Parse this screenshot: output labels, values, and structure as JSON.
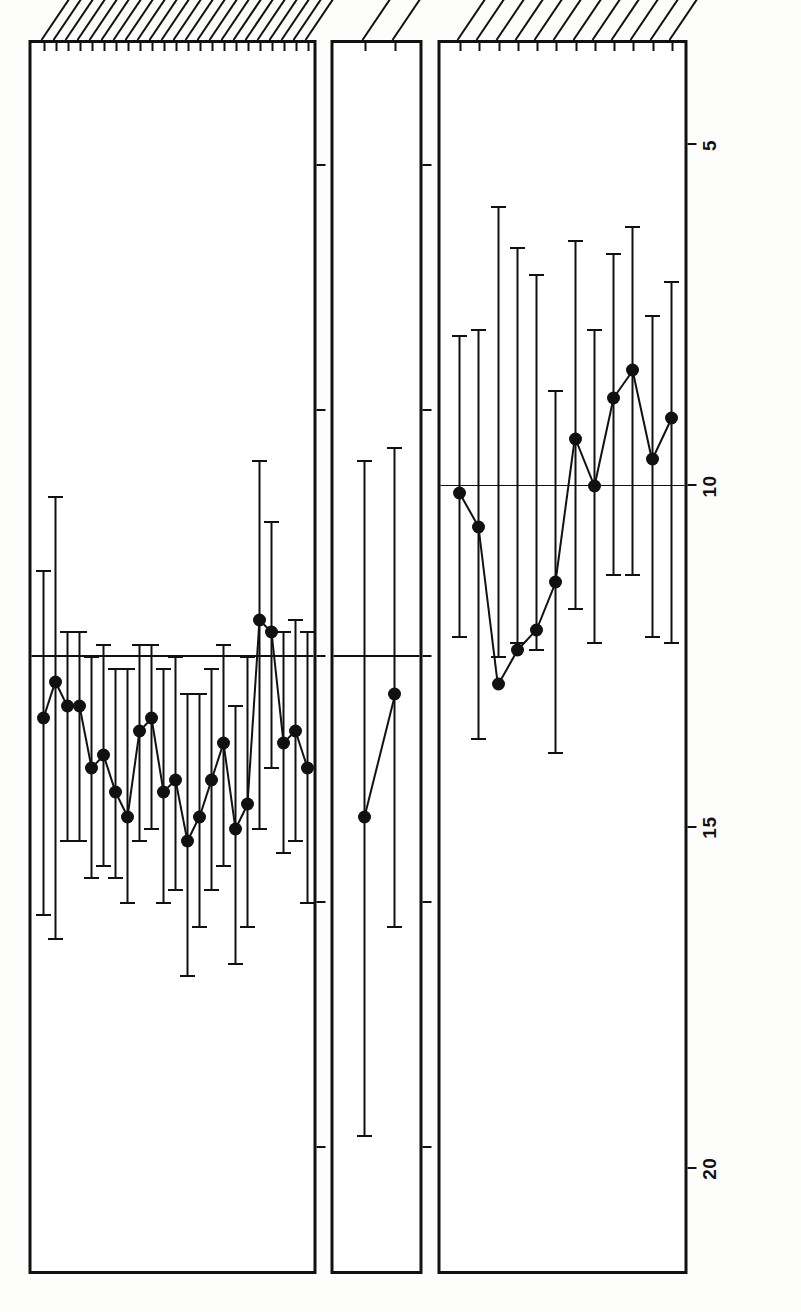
{
  "figure": {
    "orientation": "rotated-90-ccw",
    "background": "#ffffff",
    "ink": "#111111"
  },
  "chart_data": {
    "type": "scatter",
    "title": "",
    "subtitle": "",
    "panels": [
      {
        "id": "t-scores",
        "super_label": "T SCORES",
        "xlabel": "T Score",
        "ticks": [
          70,
          60,
          50,
          40,
          30
        ],
        "tick_labels": [
          "70",
          "60",
          "50",
          "40",
          "30"
        ],
        "xlim": [
          75,
          25
        ],
        "reference_value": 50,
        "grid": false,
        "groups": [
          {
            "label": "MOTOR",
            "from": 0,
            "to": 5
          },
          {
            "label": "PERC—MOTOR",
            "from": 6,
            "to": 9
          },
          {
            "label": "TACTUAL",
            "from": 10,
            "to": 13
          }
        ],
        "categories": [
          "Dyn D",
          "N",
          "Foot D",
          "N",
          "Fin D",
          "N",
          "Std D",
          "N",
          "Maz D",
          "N",
          "Peg D",
          "N",
          "Tac D",
          "N",
          "FAg D",
          "N",
          "L",
          "M",
          "TPT T",
          "CAT",
          "RL",
          "DRAW",
          "MATR"
        ],
        "values": [
          52.5,
          51.0,
          52.0,
          52.0,
          54.5,
          54.0,
          55.5,
          56.5,
          53.0,
          52.5,
          55.5,
          55.0,
          57.5,
          56.5,
          55.0,
          53.5,
          57.0,
          56.0,
          48.5,
          49.0,
          53.5,
          53.0,
          54.5
        ],
        "err_low": [
          46.5,
          43.5,
          49.0,
          49.0,
          50.0,
          49.5,
          50.5,
          50.5,
          49.5,
          49.5,
          50.5,
          50.0,
          51.5,
          51.5,
          50.5,
          49.5,
          52.0,
          50.0,
          42.0,
          44.5,
          49.0,
          48.5,
          49.0
        ],
        "err_high": [
          60.5,
          61.5,
          57.5,
          57.5,
          59.0,
          58.5,
          59.0,
          60.0,
          57.5,
          57.0,
          60.0,
          59.5,
          63.0,
          61.0,
          59.5,
          58.5,
          62.5,
          61.0,
          57.0,
          54.5,
          58.0,
          57.5,
          60.0
        ]
      },
      {
        "id": "maca-quotients",
        "super_label": "MA/CA QUOTIENTS",
        "xlabel": "Quotient",
        "ticks": [
          140,
          120,
          100,
          80,
          60
        ],
        "tick_labels": [
          "140",
          "120",
          "100",
          "80",
          "60"
        ],
        "xlim": [
          150,
          50
        ],
        "reference_value": 100,
        "grid": false,
        "groups": [],
        "categories": [
          "KNOX",
          "PVT"
        ],
        "values": [
          113.0,
          103.0
        ],
        "err_low": [
          84.0,
          83.0
        ],
        "err_high": [
          139.0,
          122.0
        ]
      },
      {
        "id": "wisc-scaled-scores",
        "super_label": "WISC SCALED SCORES",
        "xlabel": "Scaled Score",
        "ticks": [
          20,
          15,
          10,
          5
        ],
        "tick_labels": [
          "20",
          "15",
          "10",
          "5"
        ],
        "xlim": [
          21.5,
          3.5
        ],
        "reference_value": 10,
        "grid": false,
        "groups": [
          {
            "label": "PERFORMANCE",
            "from": 0,
            "to": 5
          },
          {
            "label": "VERBAL",
            "from": 6,
            "to": 11
          }
        ],
        "categories": [
          "MAZE",
          "CODE",
          "OBJ AS",
          "BL DES",
          "PIC C",
          "PIC A",
          "VOCAB",
          "SIM",
          "ARITH",
          "DIG SP",
          "COMP",
          "INF"
        ],
        "values": [
          10.1,
          10.6,
          12.9,
          12.4,
          12.1,
          11.4,
          9.3,
          10.0,
          8.7,
          8.3,
          9.6,
          9.0
        ],
        "err_low": [
          7.8,
          7.7,
          5.9,
          6.5,
          6.9,
          8.6,
          6.4,
          7.7,
          6.6,
          6.2,
          7.5,
          7.0
        ],
        "err_high": [
          12.2,
          13.7,
          12.5,
          12.3,
          12.4,
          13.9,
          11.8,
          12.3,
          11.3,
          11.3,
          12.2,
          12.3
        ]
      }
    ],
    "legend": []
  }
}
